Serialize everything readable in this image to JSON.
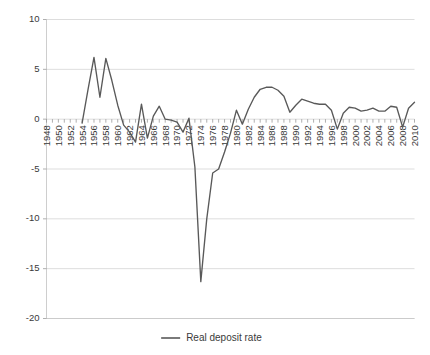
{
  "chart_data": {
    "type": "line",
    "title": "",
    "subtitle": "",
    "xlabel": "",
    "ylabel": "",
    "xlim": [
      1948,
      2010
    ],
    "ylim": [
      -20,
      10
    ],
    "ytick_labels": [
      "10",
      "5",
      "0",
      "-5",
      "-10",
      "-15",
      "-20"
    ],
    "ytick_values": [
      10,
      5,
      0,
      -5,
      -10,
      -15,
      -20
    ],
    "grid": "horizontal",
    "legend_position": "bottom-center",
    "legend": [
      "Real deposit rate"
    ],
    "xtick_labels": [
      "1948",
      "1950",
      "1952",
      "1954",
      "1956",
      "1958",
      "1960",
      "1962",
      "1964",
      "1966",
      "1968",
      "1970",
      "1972",
      "1974",
      "1976",
      "1978",
      "1980",
      "1982",
      "1984",
      "1986",
      "1988",
      "1990",
      "1992",
      "1994",
      "1996",
      "1998",
      "2000",
      "2002",
      "2004",
      "2006",
      "2008",
      "2010"
    ],
    "xtick_values": [
      1948,
      1950,
      1952,
      1954,
      1956,
      1958,
      1960,
      1962,
      1964,
      1966,
      1968,
      1970,
      1972,
      1974,
      1976,
      1978,
      1980,
      1982,
      1984,
      1986,
      1988,
      1990,
      1992,
      1994,
      1996,
      1998,
      2000,
      2002,
      2004,
      2006,
      2008,
      2010
    ],
    "minor_xticks_every": 1,
    "series": [
      {
        "name": "Real deposit rate",
        "color": "#595959",
        "x": [
          1954,
          1955,
          1956,
          1957,
          1958,
          1959,
          1960,
          1961,
          1962,
          1963,
          1964,
          1965,
          1966,
          1967,
          1968,
          1969,
          1970,
          1971,
          1972,
          1973,
          1974,
          1975,
          1976,
          1977,
          1978,
          1979,
          1980,
          1981,
          1982,
          1983,
          1984,
          1985,
          1986,
          1987,
          1988,
          1989,
          1990,
          1991,
          1992,
          1993,
          1994,
          1995,
          1996,
          1997,
          1998,
          1999,
          2000,
          2001,
          2002,
          2003,
          2004,
          2005,
          2006,
          2007,
          2008,
          2009,
          2010
        ],
        "values": [
          -0.4,
          3.0,
          6.2,
          2.2,
          6.1,
          3.9,
          1.4,
          -0.6,
          -1.3,
          -2.3,
          1.5,
          -1.9,
          0.3,
          1.3,
          0.0,
          -0.1,
          -0.3,
          -1.3,
          0.1,
          -4.8,
          -16.3,
          -10.0,
          -5.4,
          -5.0,
          -3.3,
          -1.4,
          0.9,
          -0.5,
          1.0,
          2.2,
          3.0,
          3.2,
          3.2,
          2.9,
          2.3,
          0.7,
          1.4,
          2.0,
          1.8,
          1.6,
          1.5,
          1.5,
          0.9,
          -1.0,
          0.6,
          1.2,
          1.1,
          0.8,
          0.9,
          1.1,
          0.8,
          0.8,
          1.3,
          1.2,
          -0.8,
          1.1,
          1.7
        ]
      }
    ]
  }
}
